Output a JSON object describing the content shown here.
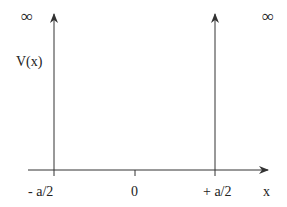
{
  "diagram": {
    "labels": {
      "infinity_left": "∞",
      "infinity_right": "∞",
      "y_axis": "V(x)",
      "x_axis": "x",
      "tick_left": "- a/2",
      "tick_center": "0",
      "tick_right": "+ a/2"
    },
    "colors": {
      "line": "#333333",
      "text": "#222222",
      "background": "#ffffff"
    }
  }
}
